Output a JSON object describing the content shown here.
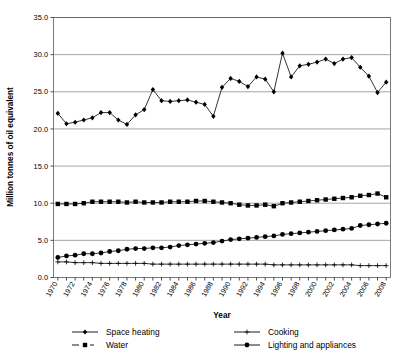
{
  "chart_data": {
    "type": "line",
    "title": "",
    "xlabel": "Year",
    "ylabel": "Million tonnes of oil equivalent",
    "ylim": [
      0.0,
      35.0
    ],
    "yticks": [
      "0.0",
      "5.0",
      "10.0",
      "15.0",
      "20.0",
      "25.0",
      "30.0",
      "35.0"
    ],
    "grid": true,
    "legend_position": "bottom",
    "x": [
      1970,
      1971,
      1972,
      1973,
      1974,
      1975,
      1976,
      1977,
      1978,
      1979,
      1980,
      1981,
      1982,
      1983,
      1984,
      1985,
      1986,
      1987,
      1988,
      1989,
      1990,
      1991,
      1992,
      1993,
      1994,
      1995,
      1996,
      1997,
      1998,
      1999,
      2000,
      2001,
      2002,
      2003,
      2004,
      2005,
      2006,
      2007,
      2008
    ],
    "xticklabels": [
      "1970",
      "1971",
      "1972",
      "1973",
      "1974",
      "1975",
      "1976",
      "1977",
      "1978",
      "1979",
      "1980",
      "1981",
      "1982",
      "1983",
      "1984",
      "1985",
      "1986",
      "1987",
      "1988",
      "1989",
      "1990",
      "1991",
      "1992",
      "1993",
      "1994",
      "1995",
      "1996",
      "1997",
      "1998",
      "1999",
      "2000",
      "2001",
      "2002",
      "2003",
      "2004",
      "2005",
      "2006",
      "2007",
      "2008"
    ],
    "xticklabels_shown": [
      "1970",
      "1972",
      "1974",
      "1976",
      "1978",
      "1980",
      "1982",
      "1984",
      "1986",
      "1988",
      "1990",
      "1992",
      "1994",
      "1996",
      "1998",
      "2000",
      "2002",
      "2004",
      "2006",
      "2008"
    ],
    "series": [
      {
        "name": "Space heating",
        "marker": "diamond",
        "color": "#000000",
        "values": [
          22.1,
          20.7,
          20.9,
          21.2,
          21.5,
          22.2,
          22.2,
          21.2,
          20.6,
          21.9,
          22.6,
          25.3,
          23.8,
          23.7,
          23.8,
          23.9,
          23.6,
          23.3,
          21.7,
          25.6,
          26.8,
          26.4,
          25.7,
          27.0,
          26.7,
          25.0,
          30.2,
          27.0,
          28.5,
          28.7,
          29.0,
          29.4,
          28.8,
          29.4,
          29.6,
          28.3,
          27.1,
          24.9,
          26.3
        ]
      },
      {
        "name": "Water",
        "marker": "square",
        "color": "#000000",
        "values": [
          9.9,
          9.9,
          9.9,
          10.0,
          10.2,
          10.2,
          10.2,
          10.2,
          10.1,
          10.2,
          10.1,
          10.1,
          10.1,
          10.2,
          10.2,
          10.2,
          10.3,
          10.3,
          10.2,
          10.1,
          10.0,
          9.8,
          9.7,
          9.7,
          9.8,
          9.6,
          10.0,
          10.1,
          10.2,
          10.3,
          10.4,
          10.5,
          10.6,
          10.7,
          10.8,
          11.0,
          11.1,
          11.3,
          10.8
        ]
      },
      {
        "name": "Cooking",
        "marker": "plus",
        "color": "#000000",
        "values": [
          2.1,
          2.1,
          2.0,
          2.0,
          2.0,
          1.9,
          1.9,
          1.9,
          1.9,
          1.9,
          1.9,
          1.8,
          1.8,
          1.8,
          1.8,
          1.8,
          1.8,
          1.8,
          1.8,
          1.8,
          1.8,
          1.8,
          1.8,
          1.8,
          1.8,
          1.7,
          1.7,
          1.7,
          1.7,
          1.7,
          1.7,
          1.7,
          1.7,
          1.7,
          1.7,
          1.6,
          1.6,
          1.6,
          1.6
        ]
      },
      {
        "name": "Lighting and appliances",
        "marker": "circle",
        "color": "#000000",
        "values": [
          2.7,
          2.9,
          3.0,
          3.2,
          3.2,
          3.3,
          3.5,
          3.6,
          3.8,
          3.9,
          3.9,
          4.0,
          4.0,
          4.1,
          4.3,
          4.4,
          4.5,
          4.6,
          4.7,
          4.9,
          5.1,
          5.2,
          5.3,
          5.4,
          5.5,
          5.6,
          5.8,
          5.9,
          6.0,
          6.1,
          6.2,
          6.3,
          6.4,
          6.5,
          6.6,
          7.0,
          7.1,
          7.2,
          7.3
        ]
      }
    ]
  },
  "legend": {
    "entries": [
      {
        "label": "Space heating",
        "marker": "diamond"
      },
      {
        "label": "Cooking",
        "marker": "plus"
      },
      {
        "label": "Water",
        "marker": "square"
      },
      {
        "label": "Lighting and appliances",
        "marker": "circle"
      }
    ]
  },
  "axes": {
    "x_title": "Year",
    "y_title": "Million tonnes of oil equivalent"
  }
}
